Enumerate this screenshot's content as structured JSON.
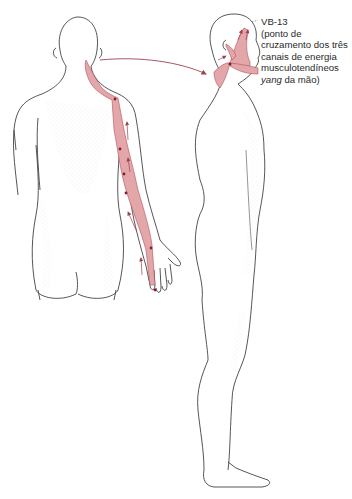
{
  "figure": {
    "type": "anatomical-meridian-illustration",
    "views": [
      {
        "name": "posterior-view",
        "description": "Back view of figure with right arm extended, showing musculotendinous channel along shoulder, arm and hand"
      },
      {
        "name": "lateral-view",
        "description": "Side view of full standing figure with channel highlighted on head and face"
      }
    ],
    "colors": {
      "channel_fill": "#e3a7a9",
      "channel_stroke": "#b05060",
      "point_marker": "#8a1a2a",
      "arrow": "#a04050",
      "outline": "#2b2b2b",
      "stipple": "#9a9a9a"
    }
  },
  "annotation": {
    "point_label": "VB-13",
    "line1": "(ponto de",
    "line2": "cruzamento dos três",
    "line3": "canais de energia",
    "line4": "musculotendíneos",
    "line5_italic": "yang",
    "line5_rest": " da mão)"
  }
}
